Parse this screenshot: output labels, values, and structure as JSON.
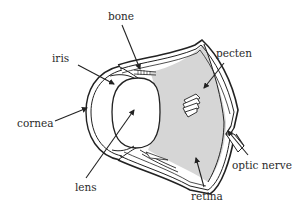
{
  "diagram": {
    "colors": {
      "stroke": "#222222",
      "fill_chamber": "#d6d6d6",
      "background": "#ffffff",
      "text": "#2a2a2a"
    },
    "labels": [
      {
        "id": "bone",
        "text": "bone"
      },
      {
        "id": "iris",
        "text": "iris"
      },
      {
        "id": "pecten",
        "text": "pecten"
      },
      {
        "id": "cornea",
        "text": "cornea"
      },
      {
        "id": "lens",
        "text": "lens"
      },
      {
        "id": "optic_nerve",
        "text": "optic nerve"
      },
      {
        "id": "retina",
        "text": "retina"
      }
    ]
  }
}
